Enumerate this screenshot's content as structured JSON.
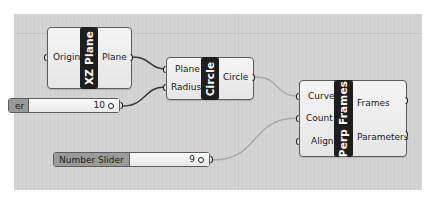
{
  "canvas": {
    "background": "#d4d4d4"
  },
  "nodes": {
    "xz_plane": {
      "title": "XZ Plane",
      "inputs": [
        "Origin"
      ],
      "outputs": [
        "Plane"
      ]
    },
    "circle": {
      "title": "Circle",
      "inputs": [
        "Plane",
        "Radius"
      ],
      "outputs": [
        "Circle"
      ]
    },
    "perp_frames": {
      "title": "Perp Frames",
      "inputs": [
        "Curve",
        "Count",
        "Align"
      ],
      "outputs": [
        "Frames",
        "Parameters"
      ]
    }
  },
  "sliders": [
    {
      "label": "er",
      "value": "10"
    },
    {
      "label": "Number Slider",
      "value": "9"
    }
  ],
  "wires": [
    {
      "from": "XZ Plane.Plane",
      "to": "Circle.Plane",
      "color": "#3a3a3a"
    },
    {
      "from": "Slider(10)",
      "to": "Circle.Radius",
      "color": "#3a3a3a"
    },
    {
      "from": "Circle.Circle",
      "to": "Perp Frames.Curve",
      "color": "#a8a8a8"
    },
    {
      "from": "Slider(9)",
      "to": "Perp Frames.Count",
      "color": "#a8a8a8"
    }
  ]
}
